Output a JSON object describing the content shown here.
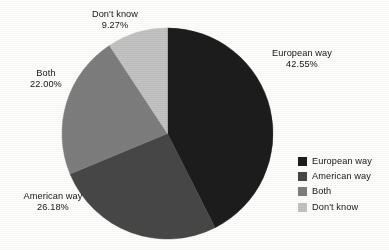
{
  "chart_data": {
    "type": "pie",
    "title": "",
    "subtitle": "",
    "xlabel": "",
    "ylabel": "",
    "legend_position": "right",
    "grid": false,
    "units": "percent",
    "start_angle_deg": 0,
    "direction": "clockwise",
    "categories": [
      "European way",
      "American way",
      "Both",
      "Don't know"
    ],
    "values": [
      42.55,
      26.18,
      22.0,
      9.27
    ],
    "value_labels": [
      "42.55%",
      "26.18%",
      "22.00%",
      "9.27%"
    ],
    "colors": [
      "#1c1c1c",
      "#474747",
      "#7d7d7d",
      "#c2c2c2"
    ],
    "slices": [
      {
        "label": "European way",
        "value": 42.55,
        "value_label": "42.55%",
        "color": "#1c1c1c"
      },
      {
        "label": "American way",
        "value": 26.18,
        "value_label": "26.18%",
        "color": "#474747"
      },
      {
        "label": "Both",
        "value": 22.0,
        "value_label": "22.00%",
        "color": "#7d7d7d"
      },
      {
        "label": "Don't know",
        "value": 9.27,
        "value_label": "9.27%",
        "color": "#c2c2c2"
      }
    ]
  },
  "callouts": {
    "dont_know": {
      "name": "Don't know",
      "value": "9.27%"
    },
    "both": {
      "name": "Both",
      "value": "22.00%"
    },
    "american": {
      "name": "American way",
      "value": "26.18%"
    },
    "european": {
      "name": "European way",
      "value": "42.55%"
    }
  },
  "legend": {
    "items": [
      {
        "label": "European way",
        "color": "#1c1c1c"
      },
      {
        "label": "American way",
        "color": "#474747"
      },
      {
        "label": "Both",
        "color": "#7d7d7d"
      },
      {
        "label": "Don't know",
        "color": "#c2c2c2"
      }
    ]
  },
  "canvas": {
    "background": "#fdfdfb",
    "text_color": "#151515"
  }
}
